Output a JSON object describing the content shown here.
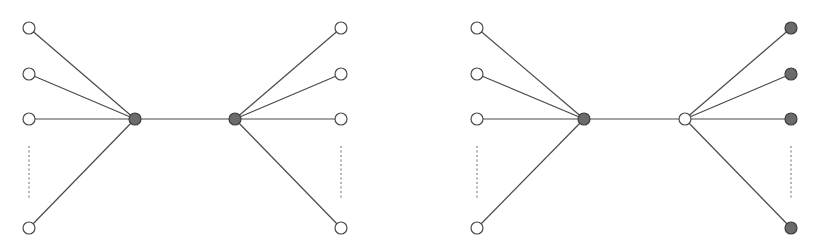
{
  "colors": {
    "edge": "#4a4a4a",
    "filled_node": "#6b6b6b",
    "open_node": "#ffffff",
    "background": "#ffffff"
  },
  "node_radius": 6,
  "graphs": [
    {
      "name": "left-graph",
      "hubs": [
        {
          "id": "hub-a",
          "x": 135,
          "y": 119,
          "filled": true
        },
        {
          "id": "hub-b",
          "x": 235,
          "y": 119,
          "filled": true
        }
      ],
      "hub_edge": [
        "hub-a",
        "hub-b"
      ],
      "left_leaves": {
        "hub": "hub-a",
        "nodes": [
          {
            "x": 29,
            "y": 28,
            "filled": false
          },
          {
            "x": 29,
            "y": 74,
            "filled": false
          },
          {
            "x": 29,
            "y": 119,
            "filled": false
          },
          {
            "x": 29,
            "y": 228,
            "filled": false
          }
        ],
        "ellipsis": {
          "x": 29,
          "y1": 146,
          "y2": 200
        }
      },
      "right_leaves": {
        "hub": "hub-b",
        "nodes": [
          {
            "x": 341,
            "y": 28,
            "filled": false
          },
          {
            "x": 341,
            "y": 74,
            "filled": false
          },
          {
            "x": 341,
            "y": 119,
            "filled": false
          },
          {
            "x": 341,
            "y": 228,
            "filled": false
          }
        ],
        "ellipsis": {
          "x": 341,
          "y1": 146,
          "y2": 200
        }
      }
    },
    {
      "name": "right-graph",
      "hubs": [
        {
          "id": "hub-a",
          "x": 584,
          "y": 119,
          "filled": true
        },
        {
          "id": "hub-b",
          "x": 685,
          "y": 119,
          "filled": false
        }
      ],
      "hub_edge": [
        "hub-a",
        "hub-b"
      ],
      "left_leaves": {
        "hub": "hub-a",
        "nodes": [
          {
            "x": 477,
            "y": 28,
            "filled": false
          },
          {
            "x": 477,
            "y": 74,
            "filled": false
          },
          {
            "x": 477,
            "y": 119,
            "filled": false
          },
          {
            "x": 477,
            "y": 228,
            "filled": false
          }
        ],
        "ellipsis": {
          "x": 477,
          "y1": 146,
          "y2": 200
        }
      },
      "right_leaves": {
        "hub": "hub-b",
        "nodes": [
          {
            "x": 791,
            "y": 28,
            "filled": true
          },
          {
            "x": 791,
            "y": 74,
            "filled": true
          },
          {
            "x": 791,
            "y": 119,
            "filled": true
          },
          {
            "x": 791,
            "y": 228,
            "filled": true
          }
        ],
        "ellipsis": {
          "x": 791,
          "y1": 146,
          "y2": 200
        }
      }
    }
  ]
}
